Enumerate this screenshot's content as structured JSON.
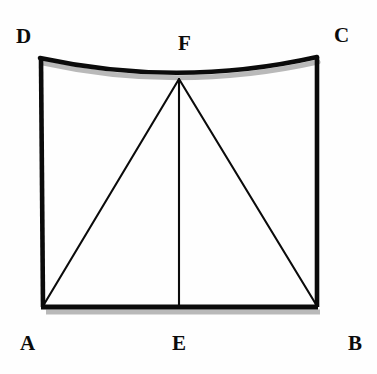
{
  "figure": {
    "background_color": "#fefefe",
    "stroke_color": "#0b0b0b",
    "shadow_color": "#b9b9b9",
    "outline_stroke_width": 4.5,
    "inner_stroke_width": 2.0,
    "canvas": {
      "width": 377,
      "height": 374
    },
    "vertices": [
      {
        "id": "D",
        "label": "D",
        "x": 40,
        "y": 58,
        "label_x": 16,
        "label_y": 26,
        "role": "top-left-corner"
      },
      {
        "id": "C",
        "label": "C",
        "x": 317,
        "y": 57,
        "label_x": 334,
        "label_y": 25,
        "role": "top-right-corner"
      },
      {
        "id": "F",
        "label": "F",
        "x": 179,
        "y": 78,
        "label_x": 178,
        "label_y": 33,
        "role": "apex-on-curve"
      },
      {
        "id": "A",
        "label": "A",
        "x": 43,
        "y": 307,
        "label_x": 20,
        "label_y": 333,
        "role": "bottom-left-corner"
      },
      {
        "id": "E",
        "label": "E",
        "x": 179,
        "y": 307,
        "label_x": 172,
        "label_y": 333,
        "role": "bottom-midpoint"
      },
      {
        "id": "B",
        "label": "B",
        "x": 317,
        "y": 307,
        "label_x": 348,
        "label_y": 333,
        "role": "bottom-right-corner"
      }
    ],
    "edges": [
      {
        "id": "DC",
        "from": "D",
        "to": "C",
        "type": "curve",
        "curvature": "concave-down",
        "weight": "thick",
        "note": "top edge sags downward passing through F"
      },
      {
        "id": "DA",
        "from": "D",
        "to": "A",
        "type": "line",
        "weight": "thick",
        "note": "left side"
      },
      {
        "id": "CB",
        "from": "C",
        "to": "B",
        "type": "line",
        "weight": "thick",
        "note": "right side"
      },
      {
        "id": "AB",
        "from": "A",
        "to": "B",
        "type": "line",
        "weight": "thick",
        "note": "bottom base"
      },
      {
        "id": "FA",
        "from": "F",
        "to": "A",
        "type": "line",
        "weight": "thin",
        "note": "diagonal to bottom-left"
      },
      {
        "id": "FE",
        "from": "F",
        "to": "E",
        "type": "line",
        "weight": "thin",
        "note": "vertical median"
      },
      {
        "id": "FB",
        "from": "F",
        "to": "B",
        "type": "line",
        "weight": "thin",
        "note": "diagonal to bottom-right"
      }
    ],
    "curve_path": "M 40 58 Q 179 88 317 57",
    "shadow_curve_path": "M 43 63 Q 179 93 318 62",
    "shadow_base_path": "M 46 312 L 320 312"
  }
}
